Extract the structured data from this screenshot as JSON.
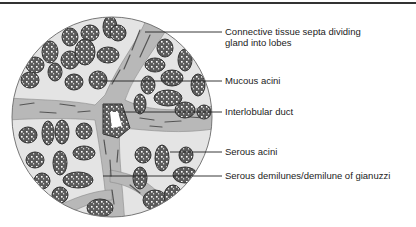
{
  "figure": {
    "type": "histology-diagram",
    "colors": {
      "background": "#ffffff",
      "stroma": "#e2e2e2",
      "septa": "#b5b5b5",
      "acinus_fill": "#5a5a5a",
      "acinus_outline": "#333333",
      "rule": "#333333"
    }
  },
  "labels": [
    {
      "id": "septa",
      "text_line1": "Connective tissue septa dividing",
      "text_line2": "gland into lobes"
    },
    {
      "id": "mucous",
      "text_line1": "Mucous acini"
    },
    {
      "id": "duct",
      "text_line1": "Interlobular duct"
    },
    {
      "id": "serous",
      "text_line1": "Serous acini"
    },
    {
      "id": "demilune",
      "text_line1": "Serous demilunes/demilune of gianuzzi"
    }
  ]
}
